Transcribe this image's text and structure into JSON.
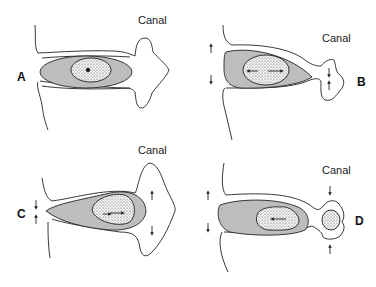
{
  "panels": [
    {
      "id": "A",
      "letter": "A",
      "canal_label": "Canal"
    },
    {
      "id": "B",
      "letter": "B",
      "canal_label": "Canal"
    },
    {
      "id": "C",
      "letter": "C",
      "canal_label": "Canal"
    },
    {
      "id": "D",
      "letter": "D",
      "canal_label": "Canal"
    }
  ],
  "colors": {
    "stroke": "#222222",
    "shade": "#bdbdbd",
    "stipple_bg": "#f4f4f4",
    "background": "#ffffff"
  }
}
